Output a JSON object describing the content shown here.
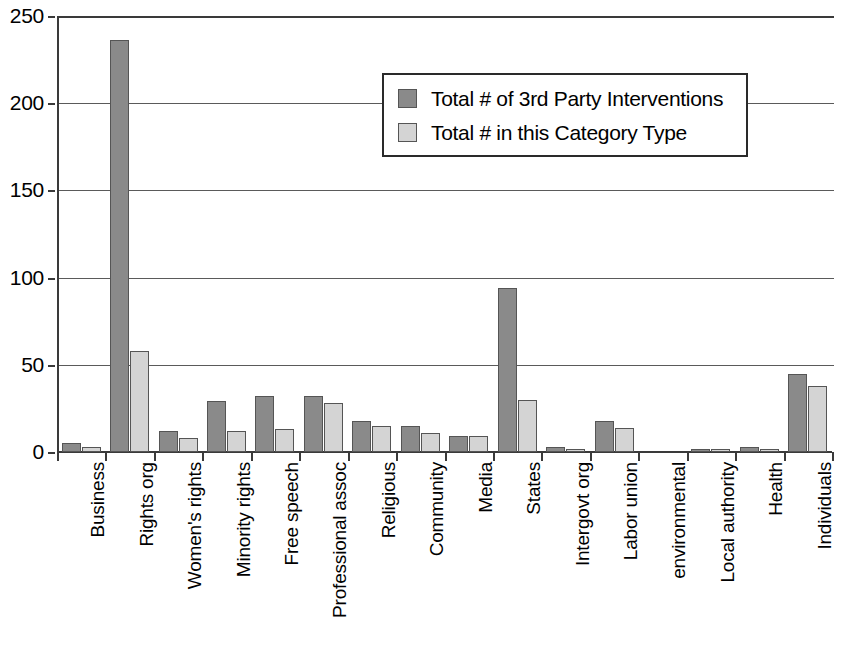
{
  "chart_data": {
    "type": "bar",
    "title": "",
    "subtitle": "",
    "xlabel": "",
    "ylabel": "",
    "ylim": [
      0,
      250
    ],
    "ytick_labels": [
      "0",
      "50",
      "100",
      "150",
      "200",
      "250"
    ],
    "ytick_values": [
      0,
      50,
      100,
      150,
      200,
      250
    ],
    "grid": true,
    "legend_position": "upper-center",
    "categories": [
      "Business",
      "Rights org",
      "Women's rights",
      "Minority rights",
      "Free speech",
      "Professional assoc",
      "Religious",
      "Community",
      "Media",
      "States",
      "Intergovt org",
      "Labor union",
      "environmental",
      "Local authority",
      "Health",
      "Individuals"
    ],
    "series": [
      {
        "name": "Total # of 3rd Party Interventions",
        "color": "#8a8a8a",
        "values": [
          5,
          236,
          12,
          29,
          32,
          32,
          18,
          15,
          9,
          94,
          3,
          18,
          0,
          2,
          3,
          45
        ]
      },
      {
        "name": "Total # in this Category Type",
        "color": "#d4d4d4",
        "values": [
          3,
          58,
          8,
          12,
          13,
          28,
          15,
          11,
          9,
          30,
          2,
          14,
          0,
          2,
          2,
          38
        ]
      }
    ]
  },
  "legend": {
    "items": [
      {
        "label": "Total # of 3rd Party Interventions",
        "swatch": "#8a8a8a"
      },
      {
        "label": "Total # in this Category Type",
        "swatch": "#d4d4d4"
      }
    ]
  },
  "axis_colors": {
    "axis_line": "#3a3a3a",
    "gridline": "#5a5a5a",
    "background": "#ffffff"
  }
}
